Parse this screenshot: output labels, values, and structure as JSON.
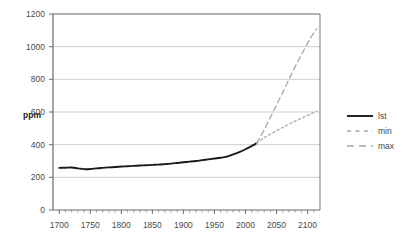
{
  "chart_data": {
    "type": "line",
    "title": "",
    "xlabel": "",
    "ylabel": "ppm",
    "xlim": [
      1690,
      2120
    ],
    "ylim": [
      0,
      1200
    ],
    "grid": true,
    "legend_position": "right",
    "x_ticks": [
      "1700",
      "1750",
      "1800",
      "1850",
      "1900",
      "1950",
      "2000",
      "2050",
      "2100"
    ],
    "x_tick_values": [
      1700,
      1750,
      1800,
      1850,
      1900,
      1950,
      2000,
      2050,
      2100
    ],
    "y_ticks": [
      "0",
      "200",
      "400",
      "600",
      "800",
      "1000",
      "1200"
    ],
    "y_tick_values": [
      0,
      200,
      400,
      600,
      800,
      1000,
      1200
    ],
    "series": [
      {
        "name": "lst",
        "style": "solid",
        "color": "#1a1a1a",
        "x": [
          1700,
          1710,
          1720,
          1730,
          1740,
          1750,
          1760,
          1770,
          1780,
          1790,
          1800,
          1810,
          1820,
          1830,
          1840,
          1850,
          1860,
          1870,
          1880,
          1890,
          1900,
          1910,
          1920,
          1930,
          1940,
          1950,
          1960,
          1970,
          1980,
          1990,
          2000,
          2005,
          2010,
          2015,
          2018
        ],
        "values": [
          258,
          259,
          260,
          255,
          250,
          251,
          255,
          258,
          261,
          263,
          266,
          268,
          270,
          272,
          274,
          276,
          278,
          281,
          284,
          288,
          292,
          296,
          300,
          305,
          310,
          315,
          320,
          327,
          340,
          355,
          372,
          382,
          392,
          402,
          410
        ]
      },
      {
        "name": "min",
        "style": "dotted",
        "color": "#a8a8a8",
        "x": [
          2018,
          2030,
          2045,
          2060,
          2075,
          2090,
          2105,
          2115
        ],
        "values": [
          410,
          442,
          475,
          505,
          535,
          562,
          588,
          605
        ]
      },
      {
        "name": "max",
        "style": "dashed",
        "color": "#a8a8a8",
        "x": [
          2018,
          2030,
          2045,
          2060,
          2075,
          2090,
          2105,
          2115
        ],
        "values": [
          410,
          490,
          605,
          720,
          840,
          950,
          1055,
          1110
        ]
      }
    ]
  },
  "legend": {
    "items": [
      {
        "label": "lst",
        "style": "solid",
        "color": "#1a1a1a"
      },
      {
        "label": "min",
        "style": "dotted",
        "color": "#a8a8a8"
      },
      {
        "label": "max",
        "style": "dashed",
        "color": "#a8a8a8"
      }
    ]
  },
  "axes": {
    "y_axis_title": "ppm"
  }
}
